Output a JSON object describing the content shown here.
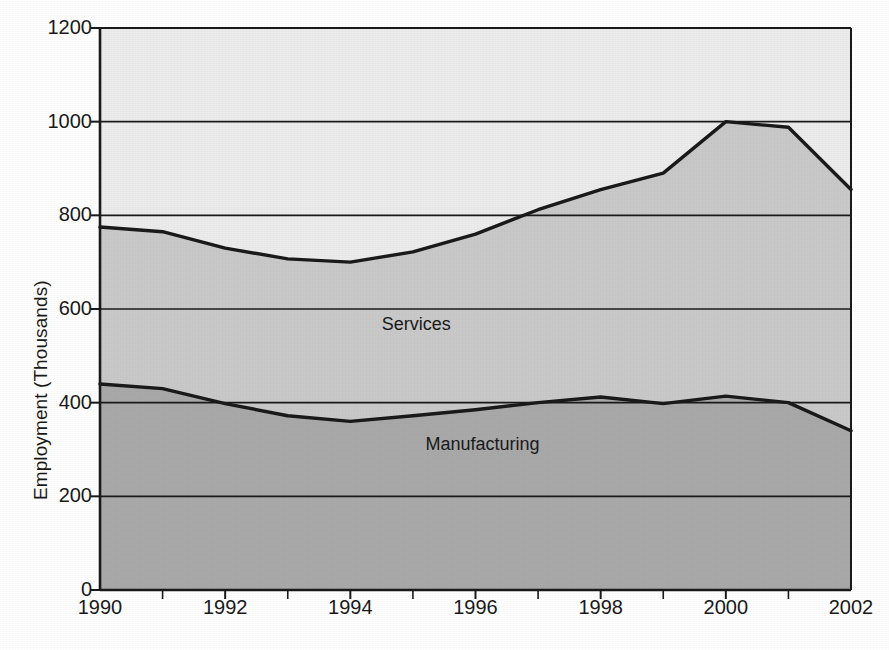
{
  "chart_data": {
    "type": "area",
    "title": "",
    "subtitle": "",
    "xlabel": "",
    "ylabel": "Employment (Thousands)",
    "xlim": [
      1990,
      2002
    ],
    "ylim": [
      0,
      1200
    ],
    "grid": true,
    "grid_axis": "y",
    "legend_position": "inline-annotation",
    "stacked": false,
    "x": [
      1990,
      1991,
      1992,
      1993,
      1994,
      1995,
      1996,
      1997,
      1998,
      1999,
      2000,
      2001,
      2002
    ],
    "xticks": [
      1990,
      1992,
      1994,
      1996,
      1998,
      2000,
      2002
    ],
    "xticklabels": [
      "1990",
      "1992",
      "1994",
      "1996",
      "1998",
      "2000",
      "2002"
    ],
    "xminor_ticks": [
      1991,
      1993,
      1995,
      1997,
      1999,
      2001
    ],
    "yticks": [
      0,
      200,
      400,
      600,
      800,
      1000,
      1200
    ],
    "yticklabels": [
      "0",
      "200",
      "400",
      "600",
      "800",
      "1000",
      "1200"
    ],
    "series": [
      {
        "name": "Services",
        "label": "Services",
        "fill_color": "#c9c9c9",
        "line_color": "#1a1a1a",
        "values": [
          775,
          765,
          730,
          707,
          700,
          722,
          760,
          812,
          855,
          890,
          1000,
          988,
          855
        ]
      },
      {
        "name": "Manufacturing",
        "label": "Manufacturing",
        "fill_color": "#a9a9a9",
        "line_color": "#1a1a1a",
        "values": [
          440,
          430,
          398,
          372,
          360,
          372,
          385,
          400,
          412,
          398,
          414,
          400,
          340
        ]
      }
    ],
    "background_band_color": "#ececec",
    "annotations": [
      {
        "text": "Services",
        "x": 1994.5,
        "y": 565
      },
      {
        "text": "Manufacturing",
        "x": 1995.2,
        "y": 310
      }
    ]
  },
  "axis": {
    "ylabel": "Employment (Thousands)"
  }
}
